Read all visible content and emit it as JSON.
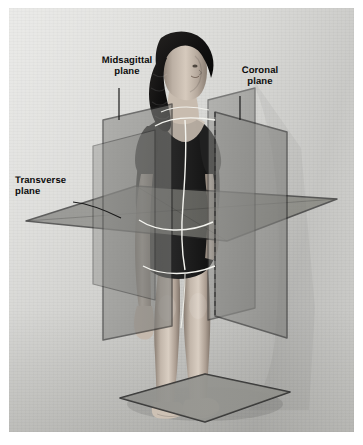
{
  "figure": {
    "background_color": "#dcdcd9",
    "plane_fill_color": "#8a8a8a",
    "plane_edge_color": "#2b2b2b",
    "highlight_line_color": "#f2f2ee",
    "label_color": "#0d0d0d"
  },
  "labels": {
    "midsagittal": "Midsagittal\nplane",
    "coronal": "Coronal\nplane",
    "transverse": "Transverse\nplane"
  },
  "planes": [
    {
      "name": "midsagittal",
      "label": "Midsagittal\nplane",
      "orientation": "vertical, divides body into left and right halves",
      "fill": "#8a8a8a",
      "opacity": 0.62
    },
    {
      "name": "coronal",
      "label": "Coronal\nplane",
      "orientation": "vertical, divides body into anterior and posterior",
      "fill": "#8a8a8a",
      "opacity": 0.6
    },
    {
      "name": "transverse",
      "label": "Transverse\nplane",
      "orientation": "horizontal, divides body into superior and inferior",
      "fill": "#7d7d7d",
      "opacity": 0.72
    }
  ],
  "leader_lines": [
    {
      "name": "midsagittal-leader",
      "from": "label",
      "to": "midsagittal plane top edge"
    },
    {
      "name": "coronal-leader",
      "from": "label",
      "to": "coronal plane top corner"
    },
    {
      "name": "transverse-leader",
      "from": "label",
      "to": "transverse plane surface"
    }
  ],
  "floor_plate": {
    "name": "floor-plate",
    "description": "gray base plate beneath the feet",
    "fill": "#9a9a97"
  }
}
